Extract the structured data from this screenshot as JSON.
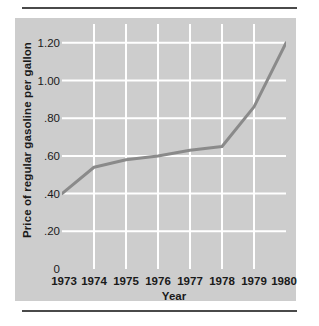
{
  "figure": {
    "background_color": "#ffffff",
    "panel_color": "#cdcdcd",
    "rule_color": "#4a4a4a"
  },
  "chart_data": {
    "type": "line",
    "title": "",
    "xlabel": "Year",
    "ylabel": "Price of regular gasoline per gallon",
    "categories": [
      "1973",
      "1974",
      "1975",
      "1976",
      "1977",
      "1978",
      "1979",
      "1980"
    ],
    "x": [
      1973,
      1974,
      1975,
      1976,
      1977,
      1978,
      1979,
      1980
    ],
    "values": [
      0.4,
      0.54,
      0.58,
      0.6,
      0.63,
      0.65,
      0.86,
      1.2
    ],
    "series": [
      {
        "name": "Price of regular gasoline per gallon",
        "values": [
          0.4,
          0.54,
          0.58,
          0.6,
          0.63,
          0.65,
          0.86,
          1.2
        ],
        "color": "#8a8a8a",
        "line_width": 3
      }
    ],
    "ylim": [
      0,
      1.3
    ],
    "xlim": [
      1973,
      1980
    ],
    "ytick_values": [
      0,
      0.2,
      0.4,
      0.6,
      0.8,
      1.0,
      1.2
    ],
    "ytick_labels": [
      "0",
      ".20",
      ".40",
      ".60",
      ".80",
      "1.00",
      "1.20"
    ],
    "xtick_labels": [
      "1973",
      "1974",
      "1975",
      "1976",
      "1977",
      "1978",
      "1979",
      "1980"
    ],
    "grid": true,
    "grid_color": "#ffffff",
    "legend": false,
    "legend_position": "none",
    "annotations": []
  }
}
